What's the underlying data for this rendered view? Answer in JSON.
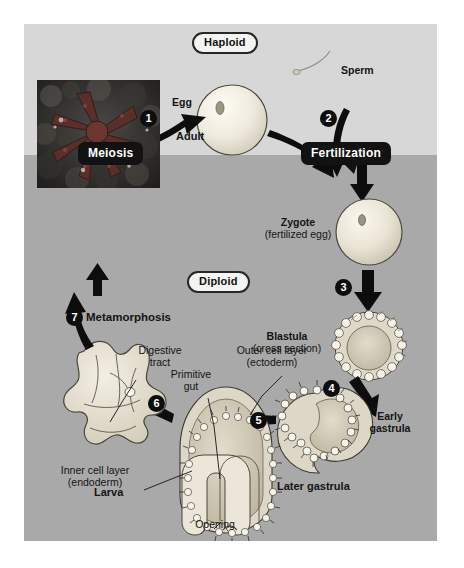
{
  "figure": {
    "zones": [
      {
        "name": "haploid_zone",
        "label": "Haploid",
        "color": "#d7d7d7"
      },
      {
        "name": "diploid_zone",
        "label": "Diploid",
        "color": "#a9a9a9"
      }
    ],
    "ploidy_labels": {
      "haploid": "Haploid",
      "diploid": "Diploid"
    },
    "process_callouts": [
      {
        "id": "meiosis",
        "label": "Meiosis"
      },
      {
        "id": "fertilization",
        "label": "Fertilization"
      },
      {
        "id": "metamorphosis",
        "label": "Metamorphosis"
      }
    ],
    "steps": [
      {
        "number": "1",
        "process": "Meiosis",
        "from": "Adult",
        "to": "Egg"
      },
      {
        "number": "2",
        "process": "Fertilization",
        "from": "Egg + Sperm",
        "to": "Zygote"
      },
      {
        "number": "3",
        "process": "Cleavage",
        "from": "Zygote",
        "to": "Blastula"
      },
      {
        "number": "4",
        "process": "Gastrulation",
        "from": "Blastula",
        "to": "Early gastrula"
      },
      {
        "number": "5",
        "process": "Development",
        "from": "Early gastrula",
        "to": "Later gastrula"
      },
      {
        "number": "6",
        "process": "Development",
        "from": "Later gastrula",
        "to": "Larva"
      },
      {
        "number": "7",
        "process": "Metamorphosis",
        "from": "Larva",
        "to": "Adult"
      }
    ],
    "stages": [
      {
        "id": "egg",
        "label": "Egg",
        "sublabel": ""
      },
      {
        "id": "sperm",
        "label": "Sperm",
        "sublabel": ""
      },
      {
        "id": "zygote",
        "label": "Zygote",
        "sublabel": "(fertilized egg)"
      },
      {
        "id": "blastula",
        "label": "Blastula",
        "sublabel": "(cross section)"
      },
      {
        "id": "early_gastrula",
        "label": "Early",
        "sublabel": "gastrula"
      },
      {
        "id": "later_gastrula",
        "label": "Later gastrula",
        "sublabel": ""
      },
      {
        "id": "larva",
        "label": "Larva",
        "sublabel": ""
      },
      {
        "id": "adult",
        "label": "Adult",
        "sublabel": ""
      }
    ],
    "anatomy_labels": [
      {
        "id": "outer_cell_layer",
        "label": "Outer cell layer",
        "sublabel": "(ectoderm)"
      },
      {
        "id": "inner_cell_layer",
        "label": "Inner cell layer",
        "sublabel": "(endoderm)"
      },
      {
        "id": "primitive_gut",
        "label": "Primitive",
        "sublabel": "gut"
      },
      {
        "id": "opening",
        "label": "Opening",
        "sublabel": ""
      },
      {
        "id": "digestive_tract",
        "label": "Digestive",
        "sublabel": "tract"
      }
    ],
    "numbers": {
      "n1": "1",
      "n2": "2",
      "n3": "3",
      "n4": "4",
      "n5": "5",
      "n6": "6",
      "n7": "7"
    },
    "colors": {
      "haploid_bg": "#d7d7d7",
      "diploid_bg": "#a9a9a9",
      "callout_bg": "#121212",
      "callout_text": "#ffffff",
      "pill_bg": "#f4f4f2",
      "arrow": "#0d0d0d",
      "cell_fill": "#efeadd",
      "page_bg": "#ffffff"
    }
  }
}
